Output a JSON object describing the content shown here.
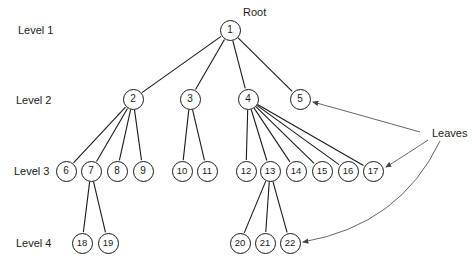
{
  "diagram": {
    "type": "tree",
    "levels": [
      {
        "label": "Level 1",
        "x": 18,
        "y": 24
      },
      {
        "label": "Level 2",
        "x": 16,
        "y": 94
      },
      {
        "label": "Level 3",
        "x": 14,
        "y": 165
      },
      {
        "label": "Level 4",
        "x": 16,
        "y": 237
      }
    ],
    "annotations": {
      "root": {
        "text": "Root",
        "x": 243,
        "y": 6
      },
      "leaves": {
        "text": "Leaves",
        "x": 432,
        "y": 127
      }
    },
    "nodes": [
      {
        "id": "1",
        "x": 230,
        "y": 30
      },
      {
        "id": "2",
        "x": 133,
        "y": 99
      },
      {
        "id": "3",
        "x": 190,
        "y": 99
      },
      {
        "id": "4",
        "x": 248,
        "y": 99
      },
      {
        "id": "5",
        "x": 300,
        "y": 99
      },
      {
        "id": "6",
        "x": 66,
        "y": 171
      },
      {
        "id": "7",
        "x": 91,
        "y": 171
      },
      {
        "id": "8",
        "x": 117,
        "y": 171
      },
      {
        "id": "9",
        "x": 143,
        "y": 171
      },
      {
        "id": "10",
        "x": 182,
        "y": 171
      },
      {
        "id": "11",
        "x": 207,
        "y": 171
      },
      {
        "id": "12",
        "x": 246,
        "y": 171
      },
      {
        "id": "13",
        "x": 270,
        "y": 171
      },
      {
        "id": "14",
        "x": 296,
        "y": 171
      },
      {
        "id": "15",
        "x": 322,
        "y": 171
      },
      {
        "id": "16",
        "x": 348,
        "y": 171
      },
      {
        "id": "17",
        "x": 373,
        "y": 171
      },
      {
        "id": "18",
        "x": 82,
        "y": 243
      },
      {
        "id": "19",
        "x": 108,
        "y": 243
      },
      {
        "id": "20",
        "x": 240,
        "y": 243
      },
      {
        "id": "21",
        "x": 265,
        "y": 243
      },
      {
        "id": "22",
        "x": 290,
        "y": 243
      }
    ],
    "edges": [
      [
        "1",
        "2"
      ],
      [
        "1",
        "3"
      ],
      [
        "1",
        "4"
      ],
      [
        "1",
        "5"
      ],
      [
        "2",
        "6"
      ],
      [
        "2",
        "7"
      ],
      [
        "2",
        "8"
      ],
      [
        "2",
        "9"
      ],
      [
        "3",
        "10"
      ],
      [
        "3",
        "11"
      ],
      [
        "4",
        "12"
      ],
      [
        "4",
        "13"
      ],
      [
        "4",
        "14"
      ],
      [
        "4",
        "15"
      ],
      [
        "4",
        "16"
      ],
      [
        "4",
        "17"
      ],
      [
        "7",
        "18"
      ],
      [
        "7",
        "19"
      ],
      [
        "13",
        "20"
      ],
      [
        "13",
        "21"
      ],
      [
        "13",
        "22"
      ]
    ],
    "leaf_arrows": [
      {
        "to": "5",
        "path": "M 420 132 Q 360 115 313 102"
      },
      {
        "to": "17",
        "path": "M 428 140 Q 410 152 386 167"
      },
      {
        "to": "22",
        "path": "M 440 141 Q 400 225 303 242"
      }
    ],
    "colors": {
      "stroke": "#1a1a1a",
      "arrow": "#555555",
      "background": "#ffffff"
    }
  }
}
